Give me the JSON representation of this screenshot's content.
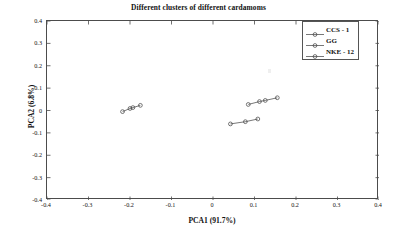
{
  "chart_data": {
    "type": "scatter",
    "title": "Different clusters of different cardamoms",
    "xlabel": "PCA1 (91.7%)",
    "ylabel": "PCA2 (6.8%)",
    "xlim": [
      -0.4,
      0.4
    ],
    "ylim": [
      -0.4,
      0.4
    ],
    "xticks": [
      "-0.4",
      "-0.3",
      "-0.2",
      "-0.1",
      "0",
      "0.1",
      "0.2",
      "0.3",
      "0.4"
    ],
    "xtick_values": [
      -0.4,
      -0.3,
      -0.2,
      -0.1,
      0,
      0.1,
      0.2,
      0.3,
      0.4
    ],
    "yticks": [
      "-0.4",
      "-0.3",
      "-0.2",
      "-0.1",
      "0",
      "0.1",
      "0.2",
      "0.3",
      "0.4"
    ],
    "ytick_values": [
      -0.4,
      -0.3,
      -0.2,
      -0.1,
      0,
      0.1,
      0.2,
      0.3,
      0.4
    ],
    "grid": false,
    "legend_position": "top-right",
    "marker": "circle",
    "connected": true,
    "series": [
      {
        "name": "CCS - 1",
        "color": "#3d3d3d",
        "points": [
          [
            -0.218,
            -0.005
          ],
          [
            -0.2,
            0.009
          ],
          [
            -0.193,
            0.013
          ],
          [
            -0.175,
            0.023
          ]
        ]
      },
      {
        "name": "GG",
        "color": "#3d3d3d",
        "points": [
          [
            0.042,
            -0.06
          ],
          [
            0.078,
            -0.05
          ],
          [
            0.108,
            -0.038
          ]
        ]
      },
      {
        "name": "NKE - 12",
        "color": "#3d3d3d",
        "points": [
          [
            0.085,
            0.027
          ],
          [
            0.112,
            0.04
          ],
          [
            0.126,
            0.045
          ],
          [
            0.155,
            0.057
          ]
        ]
      }
    ]
  },
  "figure": {
    "background_color": "#ffffff",
    "axis_color": "#4c4c4c",
    "text_color": "#111111"
  }
}
